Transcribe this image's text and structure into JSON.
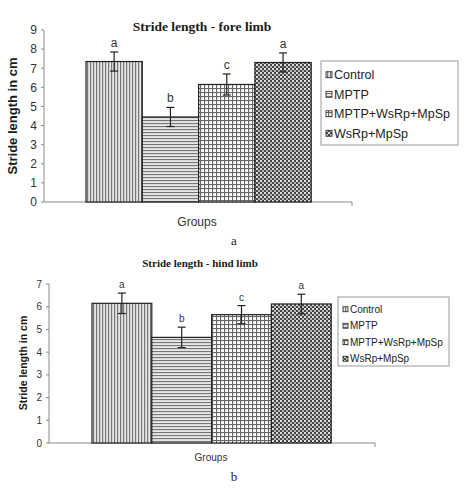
{
  "chart_data": [
    {
      "type": "bar",
      "panel_label": "a",
      "title": "Stride length - fore limb",
      "xlabel": "Groups",
      "ylabel": "Stride length in cm",
      "ylim": [
        0,
        9
      ],
      "yticks": [
        0,
        1,
        2,
        3,
        4,
        5,
        6,
        7,
        8,
        9
      ],
      "grid": false,
      "legend_position": "right",
      "categories": [
        "Groups"
      ],
      "series": [
        {
          "name": "Control",
          "pattern": "vertical-lines",
          "values": [
            7.35
          ],
          "error": [
            0.5
          ],
          "significance": "a"
        },
        {
          "name": "MPTP",
          "pattern": "horizontal-lines",
          "values": [
            4.45
          ],
          "error": [
            0.5
          ],
          "significance": "b"
        },
        {
          "name": "MPTP+WsRp+MpSp",
          "pattern": "grid",
          "values": [
            6.15
          ],
          "error": [
            0.55
          ],
          "significance": "c"
        },
        {
          "name": "WsRp+MpSp",
          "pattern": "checker",
          "values": [
            7.3
          ],
          "error": [
            0.5
          ],
          "significance": "a"
        }
      ]
    },
    {
      "type": "bar",
      "panel_label": "b",
      "title": "Stride length - hind limb",
      "xlabel": "Groups",
      "ylabel": "Stride length in cm",
      "ylim": [
        0,
        7
      ],
      "yticks": [
        0,
        1,
        2,
        3,
        4,
        5,
        6,
        7
      ],
      "grid": false,
      "legend_position": "right",
      "categories": [
        "Groups"
      ],
      "series": [
        {
          "name": "Control",
          "pattern": "vertical-lines",
          "values": [
            6.15
          ],
          "error": [
            0.45
          ],
          "significance": "a"
        },
        {
          "name": "MPTP",
          "pattern": "horizontal-lines",
          "values": [
            4.65
          ],
          "error": [
            0.45
          ],
          "significance": "b"
        },
        {
          "name": "MPTP+WsRp+MpSp",
          "pattern": "grid",
          "values": [
            5.65
          ],
          "error": [
            0.4
          ],
          "significance": "c"
        },
        {
          "name": "WsRp+MpSp",
          "pattern": "checker",
          "values": [
            6.12
          ],
          "error": [
            0.43
          ],
          "significance": "a"
        }
      ]
    }
  ],
  "colors": {
    "bar_outline": "#222222",
    "axis": "#8a8a8a",
    "legend_border": "#9a9a9a",
    "pattern_dark": "#555555",
    "pattern_light": "#ffffff"
  }
}
